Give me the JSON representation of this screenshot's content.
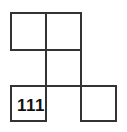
{
  "diagram": {
    "type": "grid-puzzle",
    "cell_size_px": 35,
    "cells": [
      {
        "row": 0,
        "col": 0,
        "label": ""
      },
      {
        "row": 0,
        "col": 1,
        "label": ""
      },
      {
        "row": 1,
        "col": 1,
        "label": ""
      },
      {
        "row": 2,
        "col": 0,
        "label": "111"
      },
      {
        "row": 2,
        "col": 2,
        "label": ""
      }
    ],
    "line_color": "#333333"
  }
}
